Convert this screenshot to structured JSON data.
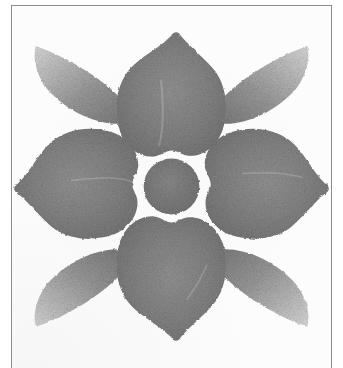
{
  "document": {
    "kind": "scanned-artwork-page",
    "caption_text": "",
    "background_color": "#fcfcfc",
    "page_color": "#ffffff",
    "frame": {
      "label": "ruled border frame",
      "color": "#8d8d8d",
      "stroke_width_px": 1,
      "left_px": 11,
      "top_px": 5,
      "width_px": 321,
      "height_px": 363,
      "open_side": "bottom"
    }
  },
  "artwork": {
    "title": "Eight-lobed rosette motif",
    "technique": "graphite rubbing / stencil print",
    "symmetry": "4-fold radial with mirrored axes",
    "center": {
      "cx": 172,
      "cy": 185
    },
    "ink": {
      "dark": "#6f6f6f",
      "mid": "#8a8a8a",
      "light": "#b8b8b8",
      "pale": "#d6d6d6"
    },
    "elements": [
      {
        "name": "center-disc",
        "shape": "circle",
        "cx": 172,
        "cy": 185,
        "r": 18,
        "tone": "#7c7c7c"
      },
      {
        "name": "petal-top",
        "shape": "cardioid-petal",
        "direction": "up",
        "tone": "#7c7c7c",
        "tip_point": true,
        "base_notch": true
      },
      {
        "name": "petal-right",
        "shape": "cardioid-petal",
        "direction": "right",
        "tone": "#7c7c7c",
        "tip_point": true,
        "base_notch": true
      },
      {
        "name": "petal-bottom",
        "shape": "cardioid-petal",
        "direction": "down",
        "tone": "#7c7c7c",
        "tip_point": true,
        "base_notch": true
      },
      {
        "name": "petal-left",
        "shape": "cardioid-petal",
        "direction": "left",
        "tone": "#7c7c7c",
        "tip_point": true,
        "base_notch": true
      },
      {
        "name": "leaf-top-left",
        "shape": "pointed-lens-leaf",
        "direction": "up-left",
        "tone_inner": "#8a8a8a",
        "tone_outer": "#cfcfcf"
      },
      {
        "name": "leaf-top-right",
        "shape": "pointed-lens-leaf",
        "direction": "up-right",
        "tone_inner": "#8a8a8a",
        "tone_outer": "#cfcfcf"
      },
      {
        "name": "leaf-bottom-right",
        "shape": "pointed-lens-leaf",
        "direction": "down-right",
        "tone_inner": "#8a8a8a",
        "tone_outer": "#cfcfcf"
      },
      {
        "name": "leaf-bottom-left",
        "shape": "pointed-lens-leaf",
        "direction": "down-left",
        "tone_inner": "#8a8a8a",
        "tone_outer": "#cfcfcf"
      }
    ]
  }
}
